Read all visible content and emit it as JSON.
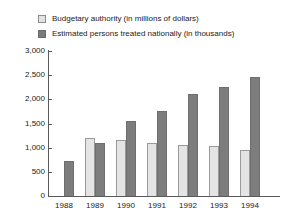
{
  "chart_data": {
    "type": "bar",
    "title": "",
    "xlabel": "",
    "ylabel": "",
    "ylim": [
      0,
      3000
    ],
    "ytick_labels": [
      "3,000",
      "2,500",
      "2,000",
      "1,500",
      "1,000",
      "500",
      "0"
    ],
    "ytick_values": [
      3000,
      2500,
      2000,
      1500,
      1000,
      500,
      0
    ],
    "grid": false,
    "legend_position": "top-left",
    "categories": [
      "1988",
      "1989",
      "1990",
      "1991",
      "1992",
      "1993",
      "1994"
    ],
    "series": [
      {
        "name": "Budgetary authority (in millions of dollars)",
        "swatch": "light",
        "color": "#e4e4e4",
        "values": [
          null,
          1200,
          1150,
          1100,
          1050,
          1030,
          960
        ]
      },
      {
        "name": "Estimated persons treated nationally (in thousands)",
        "swatch": "dark",
        "color": "#7d7d7d",
        "values": [
          720,
          1090,
          1550,
          1750,
          2110,
          2250,
          2470
        ]
      }
    ]
  },
  "legend": {
    "items": [
      {
        "label": "Budgetary authority (in millions of dollars)",
        "swatch": "light"
      },
      {
        "label": "Estimated persons treated nationally (in thousands)",
        "swatch": "dark"
      }
    ]
  },
  "axis": {
    "y_labels": [
      "3,000",
      "2,500",
      "2,000",
      "1,500",
      "1,000",
      "500",
      "0"
    ],
    "x_labels": [
      "1988",
      "1989",
      "1990",
      "1991",
      "1992",
      "1993",
      "1994"
    ]
  }
}
